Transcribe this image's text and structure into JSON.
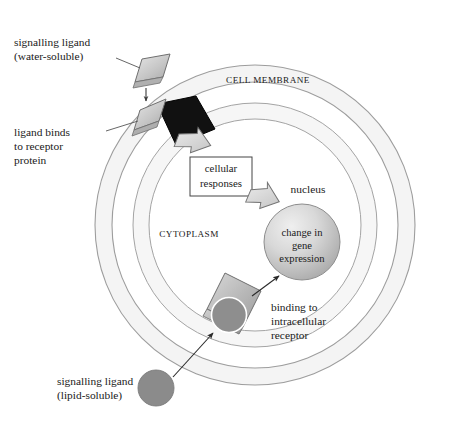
{
  "diagram": {
    "canvas": {
      "width": 449,
      "height": 433,
      "background": "#ffffff"
    },
    "cell": {
      "center_x": 255,
      "center_y": 225,
      "membrane_outer_radius": 160,
      "membrane_inner_radius": 143,
      "cytoplasm_inner_radius": 122,
      "membrane_fill": "#f5f5f5",
      "membrane_stroke": "#9a9a9a",
      "interior_fill": "#ffffff"
    },
    "labels": {
      "cell_membrane": "CELL MEMBRANE",
      "cytoplasm": "CYTOPLASM",
      "nucleus": "nucleus",
      "signalling_ligand_water": "signalling ligand",
      "signalling_ligand_water_sub": "(water-soluble)",
      "ligand_binds_line1": "ligand binds",
      "ligand_binds_line2": "to receptor",
      "ligand_binds_line3": "protein",
      "cellular_responses_line1": "cellular",
      "cellular_responses_line2": "responses",
      "gene_expression_line1": "change in",
      "gene_expression_line2": "gene",
      "gene_expression_line3": "expression",
      "binding_line1": "binding to",
      "binding_line2": "intracellular",
      "binding_line3": "receptor",
      "signalling_ligand_lipid": "signalling ligand",
      "signalling_ligand_lipid_sub": "(lipid-soluble)"
    },
    "shapes": {
      "water_ligand_free": {
        "name": "water-soluble-ligand-free",
        "kind": "parallelogram",
        "fill_light": "#e2e2e2",
        "fill_dark": "#b4b4b4",
        "stroke": "#6e6e6e"
      },
      "water_ligand_bound": {
        "name": "water-soluble-ligand-bound",
        "kind": "parallelogram",
        "fill_light": "#e2e2e2",
        "fill_dark": "#b4b4b4",
        "stroke": "#6e6e6e"
      },
      "membrane_receptor": {
        "name": "membrane-receptor-protein",
        "kind": "diamond",
        "fill": "#111111",
        "stroke": "#000000"
      },
      "nucleus": {
        "name": "nucleus-sphere",
        "kind": "circle",
        "cx": 302,
        "cy": 242,
        "r": 38,
        "fill_light": "#e6e6e6",
        "fill_dark": "#a9a9a9",
        "stroke": "#8d8d8d"
      },
      "intracellular_receptor": {
        "name": "intracellular-receptor",
        "kind": "rotated-rectangle",
        "fill_light": "#d0d0d0",
        "fill_dark": "#9d9d9d",
        "stroke": "#6e6e6e"
      },
      "lipid_ligand_bound": {
        "name": "lipid-soluble-ligand-bound",
        "kind": "circle",
        "cx": 229,
        "cy": 315,
        "r": 17,
        "fill": "#8e8e8e",
        "stroke": "#ffffff"
      },
      "lipid_ligand_free": {
        "name": "lipid-soluble-ligand-free",
        "kind": "circle",
        "cx": 156,
        "cy": 388,
        "r": 18,
        "fill": "#8b8b8b",
        "stroke": "#7a7a7a"
      },
      "cellular_responses_box": {
        "name": "cellular-responses-box",
        "x": 190,
        "y": 157,
        "width": 61,
        "height": 38,
        "fill": "#ffffff",
        "stroke": "#444444"
      }
    },
    "arrows": {
      "ligand_to_receptor": {
        "name": "arrow-ligand-to-receptor",
        "style": "thin-solid",
        "color": "#3a3a3a"
      },
      "receptor_to_responses": {
        "name": "arrow-receptor-to-responses",
        "style": "block-outline",
        "fill": "#d6d6d6",
        "stroke": "#6e6e6e"
      },
      "responses_to_nucleus": {
        "name": "arrow-responses-to-nucleus",
        "style": "block-outline",
        "fill": "#d6d6d6",
        "stroke": "#6e6e6e"
      },
      "lipid_to_receptor": {
        "name": "arrow-lipid-ligand-to-receptor",
        "style": "thin-solid",
        "color": "#2a2a2a"
      },
      "receptor_to_nucleus": {
        "name": "arrow-intracellular-receptor-to-nucleus",
        "style": "thin-solid",
        "color": "#2a2a2a"
      }
    },
    "leader_lines": {
      "color": "#555555",
      "width": 0.8
    }
  }
}
